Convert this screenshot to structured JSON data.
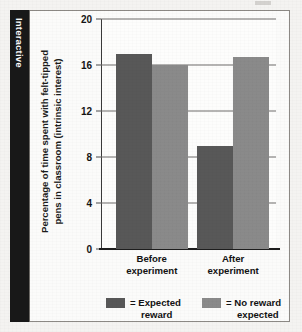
{
  "side_tab": {
    "label": "Interactive",
    "color": "#181818"
  },
  "chart_data": {
    "type": "bar",
    "title": "",
    "subtitle": "",
    "xlabel": "",
    "ylabel": "Percentage of time spent with felt-tipped pens in classroom (intrinsic interest)",
    "ylabel_line1": "Percentage of time spent with felt-tipped",
    "ylabel_line2": "pens in classroom (intrinsic interest)",
    "categories": [
      "Before experiment",
      "After experiment"
    ],
    "category_lines": [
      [
        "Before",
        "experiment"
      ],
      [
        "After",
        "experiment"
      ]
    ],
    "series": [
      {
        "name": "= Expected reward",
        "name_line1": "= Expected",
        "name_line2": "reward",
        "color": "#585858",
        "values": [
          17.0,
          9.0
        ]
      },
      {
        "name": "= No reward expected",
        "name_line1": "= No reward",
        "name_line2": "expected",
        "color": "#8a8a8a",
        "values": [
          16.0,
          16.7
        ]
      }
    ],
    "ylim": [
      0,
      20
    ],
    "yticks": [
      0,
      4,
      8,
      12,
      16,
      20
    ],
    "ytick_labels": [
      "0",
      "4",
      "8",
      "12",
      "16",
      "20"
    ],
    "grid": true,
    "grid_axis": "y",
    "legend_position": "bottom"
  }
}
